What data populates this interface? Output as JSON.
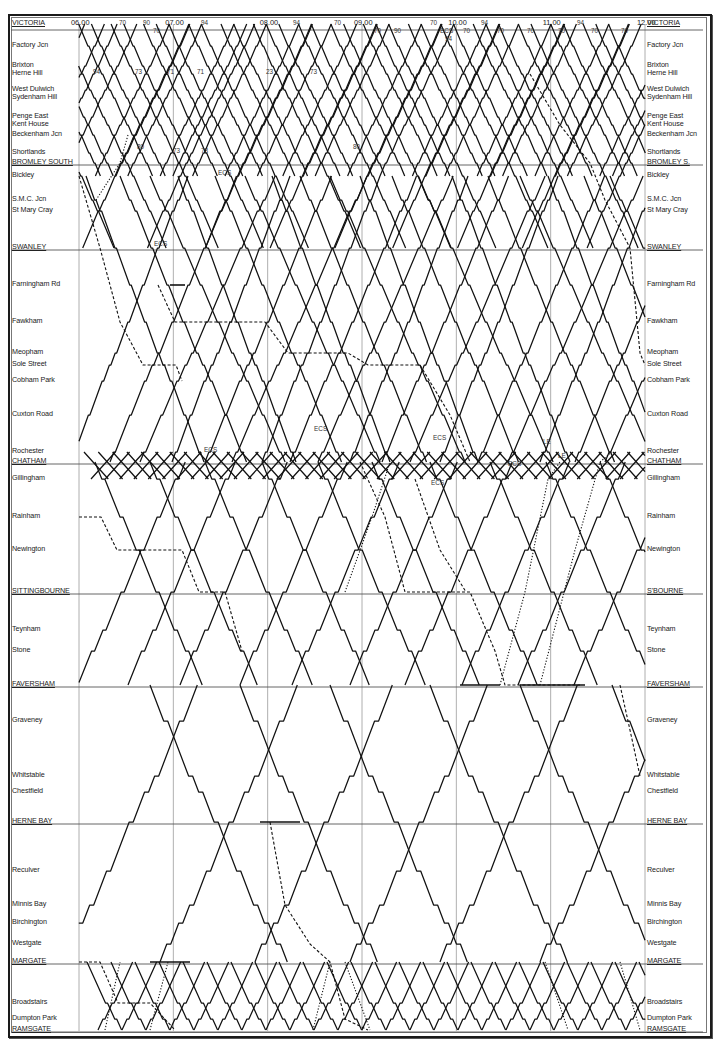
{
  "chart_data": {
    "type": "line",
    "xlabel": "Time",
    "ylabel": "Station",
    "xlim": [
      "06.00",
      "12.00"
    ],
    "grid": true,
    "time_ticks": [
      "06.00",
      "07.00",
      "08.00",
      "09.00",
      "10.00",
      "11.00",
      "12.00"
    ],
    "stations_left": [
      {
        "name": "VICTORIA",
        "major": true,
        "y": 24
      },
      {
        "name": "Factory Jcn",
        "major": false,
        "y": 46
      },
      {
        "name": "Brixton",
        "major": false,
        "y": 66
      },
      {
        "name": "Herne Hill",
        "major": false,
        "y": 74
      },
      {
        "name": "West Dulwich",
        "major": false,
        "y": 90
      },
      {
        "name": "Sydenham Hill",
        "major": false,
        "y": 98
      },
      {
        "name": "Penge East",
        "major": false,
        "y": 117
      },
      {
        "name": "Kent House",
        "major": false,
        "y": 125
      },
      {
        "name": "Beckenham Jcn",
        "major": false,
        "y": 135
      },
      {
        "name": "Shortlands",
        "major": false,
        "y": 153
      },
      {
        "name": "BROMLEY SOUTH",
        "major": true,
        "y": 163
      },
      {
        "name": "Bickley",
        "major": false,
        "y": 176
      },
      {
        "name": "S.M.C. Jcn",
        "major": false,
        "y": 200
      },
      {
        "name": "St Mary Cray",
        "major": false,
        "y": 211
      },
      {
        "name": "SWANLEY",
        "major": true,
        "y": 248
      },
      {
        "name": "Farningham Rd",
        "major": false,
        "y": 285
      },
      {
        "name": "Fawkham",
        "major": false,
        "y": 322
      },
      {
        "name": "Meopham",
        "major": false,
        "y": 353
      },
      {
        "name": "Sole Street",
        "major": false,
        "y": 365
      },
      {
        "name": "Cobham Park",
        "major": false,
        "y": 381
      },
      {
        "name": "Cuxton Road",
        "major": false,
        "y": 415
      },
      {
        "name": "Rochester",
        "major": false,
        "y": 452
      },
      {
        "name": "CHATHAM",
        "major": true,
        "y": 462
      },
      {
        "name": "Gillingham",
        "major": false,
        "y": 479
      },
      {
        "name": "Rainham",
        "major": false,
        "y": 517
      },
      {
        "name": "Newington",
        "major": false,
        "y": 550
      },
      {
        "name": "SITTINGBOURNE",
        "major": true,
        "y": 592
      },
      {
        "name": "Teynham",
        "major": false,
        "y": 630
      },
      {
        "name": "Stone",
        "major": false,
        "y": 651
      },
      {
        "name": "FAVERSHAM",
        "major": true,
        "y": 685
      },
      {
        "name": "Graveney",
        "major": false,
        "y": 721
      },
      {
        "name": "Whitstable",
        "major": false,
        "y": 776
      },
      {
        "name": "Chestfield",
        "major": false,
        "y": 792
      },
      {
        "name": "HERNE BAY",
        "major": true,
        "y": 822
      },
      {
        "name": "Reculver",
        "major": false,
        "y": 871
      },
      {
        "name": "Minnis Bay",
        "major": false,
        "y": 905
      },
      {
        "name": "Birchington",
        "major": false,
        "y": 923
      },
      {
        "name": "Westgate",
        "major": false,
        "y": 944
      },
      {
        "name": "MARGATE",
        "major": true,
        "y": 962
      },
      {
        "name": "Broadstairs",
        "major": false,
        "y": 1003
      },
      {
        "name": "Dumpton Park",
        "major": false,
        "y": 1019
      },
      {
        "name": "RAMSGATE",
        "major": true,
        "y": 1030
      }
    ],
    "stations_right_labels": [
      "VICTORIA",
      "Factory Jcn",
      "Brixton",
      "Herne Hill",
      "West Dulwich",
      "Sydenham Hill",
      "Penge East",
      "Kent House",
      "Beckenham Jcn",
      "Shortlands",
      "BROMLEY S.",
      "Bickley",
      "S.M.C. Jcn",
      "St Mary Cray",
      "SWANLEY",
      "Farningham Rd",
      "Fawkham",
      "Meopham",
      "Sole Street",
      "Cobham Park",
      "Cuxton Road",
      "Rochester",
      "CHATHAM",
      "Gillingham",
      "Rainham",
      "Newington",
      "S'BOURNE",
      "Teynham",
      "Stone",
      "FAVERSHAM",
      "Graveney",
      "Whitstable",
      "Chestfield",
      "HERNE BAY",
      "Reculver",
      "Minnis Bay",
      "Birchington",
      "Westgate",
      "MARGATE",
      "Broadstairs",
      "Dumpton Park",
      "RAMSGATE"
    ],
    "top_annotations": [
      {
        "text": "70",
        "x": 119,
        "y": 24
      },
      {
        "text": "90",
        "x": 143,
        "y": 24
      },
      {
        "text": "70",
        "x": 153,
        "y": 32
      },
      {
        "text": "94",
        "x": 201,
        "y": 24
      },
      {
        "text": "94",
        "x": 293,
        "y": 24
      },
      {
        "text": "70",
        "x": 334,
        "y": 24
      },
      {
        "text": "70",
        "x": 374,
        "y": 32
      },
      {
        "text": "90",
        "x": 394,
        "y": 32
      },
      {
        "text": "70",
        "x": 430,
        "y": 24
      },
      {
        "text": "ECS",
        "x": 440,
        "y": 32
      },
      {
        "text": "94",
        "x": 445,
        "y": 40
      },
      {
        "text": "70",
        "x": 463,
        "y": 32
      },
      {
        "text": "94",
        "x": 481,
        "y": 24
      },
      {
        "text": "70",
        "x": 497,
        "y": 32
      },
      {
        "text": "70",
        "x": 527,
        "y": 32
      },
      {
        "text": "70",
        "x": 558,
        "y": 32
      },
      {
        "text": "94",
        "x": 577,
        "y": 24
      },
      {
        "text": "70",
        "x": 591,
        "y": 32
      },
      {
        "text": "70",
        "x": 621,
        "y": 32
      }
    ],
    "mid_annotations": [
      {
        "text": "94",
        "x": 93,
        "y": 73
      },
      {
        "text": "73",
        "x": 135,
        "y": 73
      },
      {
        "text": "71",
        "x": 167,
        "y": 73
      },
      {
        "text": "71",
        "x": 197,
        "y": 73
      },
      {
        "text": "23",
        "x": 266,
        "y": 73
      },
      {
        "text": "73",
        "x": 310,
        "y": 73
      },
      {
        "text": "80",
        "x": 137,
        "y": 148
      },
      {
        "text": "73",
        "x": 173,
        "y": 152
      },
      {
        "text": "73",
        "x": 201,
        "y": 152
      },
      {
        "text": "ECS",
        "x": 218,
        "y": 174
      },
      {
        "text": "80",
        "x": 353,
        "y": 148
      },
      {
        "text": "ECS",
        "x": 154,
        "y": 245
      },
      {
        "text": "ECS",
        "x": 314,
        "y": 430
      },
      {
        "text": "ECS",
        "x": 433,
        "y": 439
      },
      {
        "text": "LE",
        "x": 543,
        "y": 443
      },
      {
        "text": "LE",
        "x": 558,
        "y": 457
      },
      {
        "text": "ECS",
        "x": 204,
        "y": 451
      },
      {
        "text": "ECS",
        "x": 508,
        "y": 465
      },
      {
        "text": "ECS",
        "x": 431,
        "y": 484
      }
    ],
    "series_legend": [
      {
        "name": "Passenger service",
        "style": "solid"
      },
      {
        "name": "Freight / parcels",
        "style": "dashed"
      },
      {
        "name": "Light engine / empty stock",
        "style": "dotted"
      }
    ]
  }
}
